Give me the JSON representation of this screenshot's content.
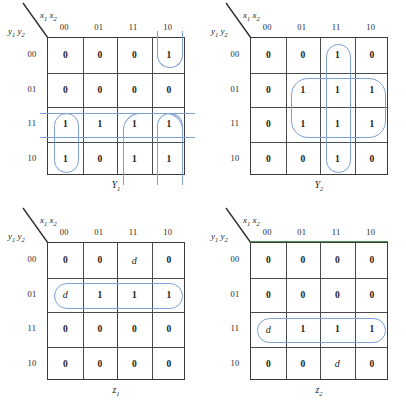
{
  "figure": {
    "type": "karnaugh-map-set",
    "map_count": 4,
    "loop_color": "#7c9fd4",
    "grid_color": "#3a3a3a"
  },
  "axis": {
    "col_var": "x",
    "col_sub1": "1",
    "col_sub2": "2",
    "row_var": "y",
    "row_sub1": "1",
    "row_sub2": "2",
    "col_headers": [
      "00",
      "01",
      "11",
      "10"
    ],
    "row_headers": [
      "00",
      "01",
      "11",
      "10"
    ]
  },
  "maps": [
    {
      "id": "Y1",
      "caption_base": "Y",
      "caption_sub": "1",
      "position": "top-left",
      "cells": [
        [
          "0",
          "0",
          "0",
          "1"
        ],
        [
          "0",
          "0",
          "0",
          "0"
        ],
        [
          "1",
          "1",
          "1",
          "1"
        ],
        [
          "1",
          "0",
          "1",
          "1"
        ]
      ],
      "loops": [
        {
          "name": "col-10-row-00",
          "r0": 0,
          "c0": 3,
          "rows": 1,
          "cols": 1,
          "open": "t"
        },
        {
          "name": "col-10-rows-11-10",
          "r0": 2,
          "c0": 3,
          "rows": 2,
          "cols": 1,
          "open": "b"
        },
        {
          "name": "col-00-rows-11-10",
          "r0": 2,
          "c0": 0,
          "rows": 2,
          "cols": 1,
          "open": ""
        },
        {
          "name": "cols-11-10-rows-11-10",
          "r0": 2,
          "c0": 2,
          "rows": 2,
          "cols": 2,
          "open": "b"
        },
        {
          "name": "row-11-wrap",
          "r0": 2,
          "c0": 0,
          "rows": 1,
          "cols": 4,
          "open": "lr"
        }
      ]
    },
    {
      "id": "Y2",
      "caption_base": "Y",
      "caption_sub": "2",
      "position": "top-right",
      "cells": [
        [
          "0",
          "0",
          "1",
          "0"
        ],
        [
          "0",
          "1",
          "1",
          "1"
        ],
        [
          "0",
          "1",
          "1",
          "1"
        ],
        [
          "0",
          "0",
          "1",
          "0"
        ]
      ],
      "loops": [
        {
          "name": "col-11-all-rows",
          "r0": 0,
          "c0": 2,
          "rows": 4,
          "cols": 1,
          "open": ""
        },
        {
          "name": "cols-01-11-10-rows-01-11",
          "r0": 1,
          "c0": 1,
          "rows": 2,
          "cols": 3,
          "open": ""
        }
      ]
    },
    {
      "id": "z1",
      "caption_base": "z",
      "caption_sub": "1",
      "position": "bottom-left",
      "cells": [
        [
          "0",
          "0",
          "d",
          "0"
        ],
        [
          "d",
          "1",
          "1",
          "1"
        ],
        [
          "0",
          "0",
          "0",
          "0"
        ],
        [
          "0",
          "0",
          "0",
          "0"
        ]
      ],
      "loops": [
        {
          "name": "row-01-all-cols",
          "r0": 1,
          "c0": 0,
          "rows": 1,
          "cols": 4,
          "open": ""
        }
      ]
    },
    {
      "id": "z2",
      "caption_base": "z",
      "caption_sub": "2",
      "position": "bottom-right",
      "cells": [
        [
          "0",
          "0",
          "0",
          "0"
        ],
        [
          "0",
          "0",
          "0",
          "0"
        ],
        [
          "d",
          "1",
          "1",
          "1"
        ],
        [
          "0",
          "0",
          "d",
          "0"
        ]
      ],
      "loops": [
        {
          "name": "row-11-all-cols",
          "r0": 2,
          "c0": 0,
          "rows": 1,
          "cols": 4,
          "open": ""
        }
      ],
      "has_green_top_border": true
    }
  ]
}
